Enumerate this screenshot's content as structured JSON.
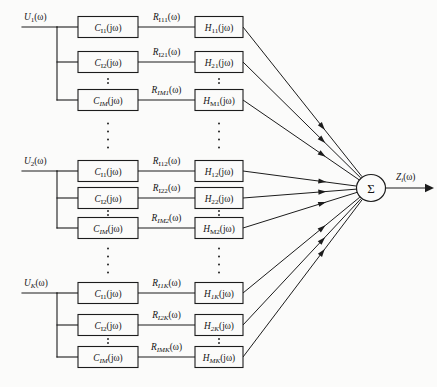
{
  "diagram": {
    "output": {
      "label_main": "Z",
      "label_sub": "i",
      "label_tail": "(ω)",
      "name": "Zi(omega)"
    },
    "summing_node": {
      "symbol": "Σ",
      "name": "summation-node"
    },
    "colors": {
      "background": "#fbfbfa",
      "line": "#1c1c1c",
      "text": "#141414",
      "box_fill": "#fbfbfa"
    },
    "groups": [
      {
        "input": {
          "main": "U",
          "sub": "1",
          "tail": "(ω)"
        },
        "rows": [
          {
            "c": {
              "main": "C",
              "sub": "I1",
              "tail": "(jω)"
            },
            "r": {
              "main": "R",
              "sub": "I11",
              "tail": "(ω)"
            },
            "h": {
              "main": "H",
              "sub": "11",
              "tail": "(jω)"
            }
          },
          {
            "c": {
              "main": "C",
              "sub": "I2",
              "tail": "(jω)"
            },
            "r": {
              "main": "R",
              "sub": "I21",
              "tail": "(ω)"
            },
            "h": {
              "main": "H",
              "sub": "21",
              "tail": "(jω)"
            }
          },
          {
            "c": {
              "main": "C",
              "sub": "IM",
              "tail": "(jω)"
            },
            "r": {
              "main": "R",
              "sub": "IM1",
              "tail": "(ω)"
            },
            "h": {
              "main": "H",
              "sub": "M1",
              "tail": "(jω)"
            }
          }
        ]
      },
      {
        "input": {
          "main": "U",
          "sub": "2",
          "tail": "(ω)"
        },
        "rows": [
          {
            "c": {
              "main": "C",
              "sub": "I1",
              "tail": "(jω)"
            },
            "r": {
              "main": "R",
              "sub": "I12",
              "tail": "(ω)"
            },
            "h": {
              "main": "H",
              "sub": "12",
              "tail": "(jω)"
            }
          },
          {
            "c": {
              "main": "C",
              "sub": "I2",
              "tail": "(jω)"
            },
            "r": {
              "main": "R",
              "sub": "I22",
              "tail": "(ω)"
            },
            "h": {
              "main": "H",
              "sub": "22",
              "tail": "(jω)"
            }
          },
          {
            "c": {
              "main": "C",
              "sub": "IM",
              "tail": "(jω)"
            },
            "r": {
              "main": "R",
              "sub": "IM2",
              "tail": "(ω)"
            },
            "h": {
              "main": "H",
              "sub": "M2",
              "tail": "(jω)"
            }
          }
        ]
      },
      {
        "input": {
          "main": "U",
          "sub": "K",
          "tail": "(ω)"
        },
        "rows": [
          {
            "c": {
              "main": "C",
              "sub": "I1",
              "tail": "(jω)"
            },
            "r": {
              "main": "R",
              "sub": "I1K",
              "tail": "(ω)"
            },
            "h": {
              "main": "H",
              "sub": "1K",
              "tail": "(jω)"
            }
          },
          {
            "c": {
              "main": "C",
              "sub": "I2",
              "tail": "(jω)"
            },
            "r": {
              "main": "R",
              "sub": "I2K",
              "tail": "(ω)"
            },
            "h": {
              "main": "H",
              "sub": "2K",
              "tail": "(jω)"
            }
          },
          {
            "c": {
              "main": "C",
              "sub": "IM",
              "tail": "(jω)"
            },
            "r": {
              "main": "R",
              "sub": "IMK",
              "tail": "(ω)"
            },
            "h": {
              "main": "H",
              "sub": "MK",
              "tail": "(jω)"
            }
          }
        ]
      }
    ]
  }
}
